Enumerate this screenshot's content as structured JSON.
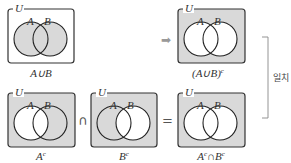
{
  "colors": {
    "shade": "#d9d9d9",
    "line": "#222222",
    "arrow": "#999999",
    "bracket": "#888888"
  },
  "diagrams": [
    {
      "id": "union",
      "universe_label": "U",
      "set_a_label": "A",
      "set_b_label": "B",
      "caption": "A∪B",
      "caption_sup": "",
      "shaded": "A-or-B"
    },
    {
      "id": "union-complement",
      "universe_label": "U",
      "set_a_label": "A",
      "set_b_label": "B",
      "caption": "(A∪B)",
      "caption_sup": "c",
      "shaded": "outside-A-and-B"
    },
    {
      "id": "a-complement",
      "universe_label": "U",
      "set_a_label": "A",
      "set_b_label": "B",
      "caption": "A",
      "caption_sup": "c",
      "shaded": "outside-A"
    },
    {
      "id": "b-complement",
      "universe_label": "U",
      "set_a_label": "A",
      "set_b_label": "B",
      "caption": "B",
      "caption_sup": "c",
      "shaded": "outside-B"
    },
    {
      "id": "ac-intersect-bc",
      "universe_label": "U",
      "set_a_label": "A",
      "set_b_label": "B",
      "caption": "A",
      "caption_sup": "c",
      "caption_mid": "∩B",
      "caption_sup2": "c",
      "shaded": "outside-A-and-B"
    }
  ],
  "operators": {
    "arrow": "➡",
    "intersect": "∩",
    "equals": "="
  },
  "bracket_label": "일치"
}
